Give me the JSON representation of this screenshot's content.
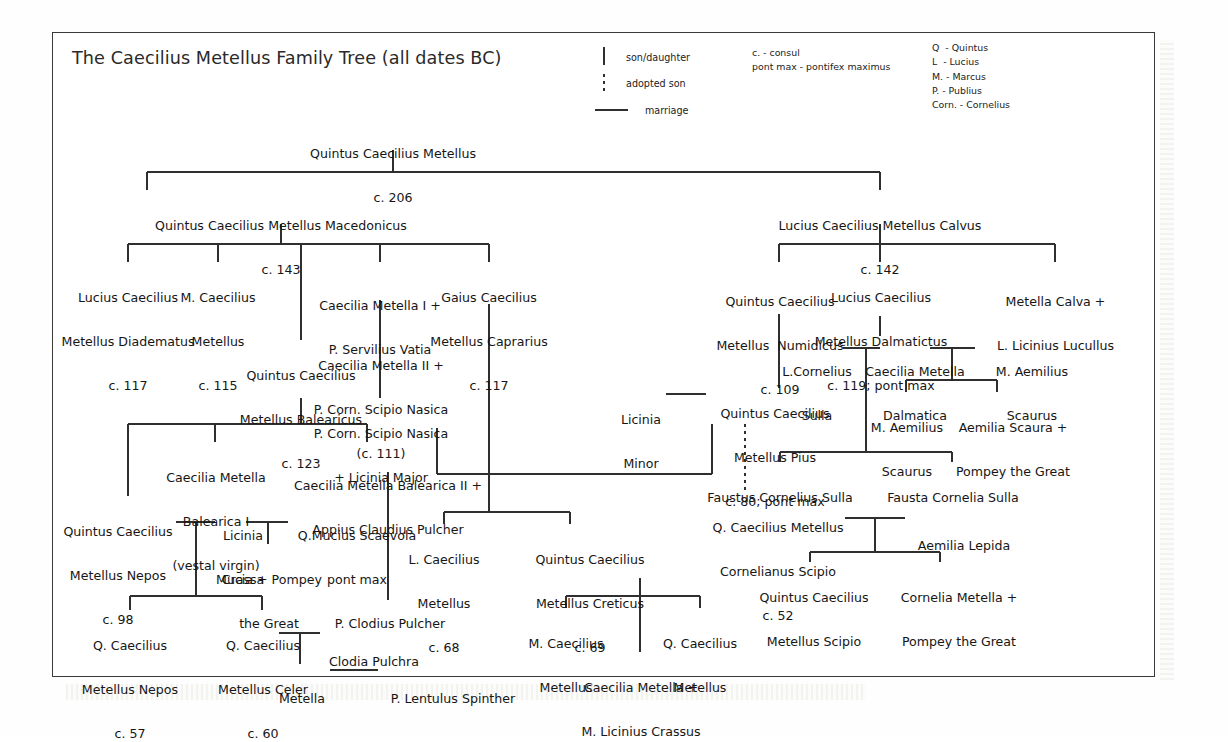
{
  "title": "The Caecilius Metellus Family Tree (all dates BC)",
  "legend": {
    "son_daughter": "son/daughter",
    "adopted_son": "adopted son",
    "marriage": "marriage",
    "abbrev_terms": "c. - consul\npont max - pontifex maximus",
    "abbrev_names": "Q  - Quintus\nL  - Lucius\nM. - Marcus\nP. - Publius\nCorn. - Cornelius"
  },
  "colors": {
    "ink": "#161616",
    "line": "#2f2f2f",
    "frame": "#3a3a3a",
    "page": "#ffffff"
  },
  "people": {
    "root": {
      "lines": [
        "Quintus Caecilius Metellus",
        "c. 206"
      ]
    },
    "macedonicus": {
      "lines": [
        "Quintus Caecilius Metellus Macedonicus",
        "c. 143"
      ]
    },
    "calvus": {
      "lines": [
        "Lucius Caecilius Metellus Calvus",
        "c. 142"
      ]
    },
    "diadematus": {
      "lines": [
        "Lucius Caecilius",
        "Metellus Diadematus",
        "c. 117"
      ]
    },
    "m_metellus": {
      "lines": [
        "M. Caecilius",
        "Metellus",
        "c. 115"
      ]
    },
    "metella1": {
      "lines": [
        "Caecilia Metella I +",
        "P. Servilius Vatia"
      ]
    },
    "caprarius": {
      "lines": [
        "Gaius Caecilius",
        "Metellus Caprarius",
        "c. 117"
      ]
    },
    "numidicus": {
      "lines": [
        "Quintus Caecilius",
        "Metellus  Numidicus",
        "c. 109"
      ]
    },
    "dalmaticus": {
      "lines": [
        "Lucius Caecilius",
        "Metellus Dalmatictus",
        "c. 119; pont max"
      ]
    },
    "metella_calva": {
      "lines": [
        "Metella Calva +",
        "L. Licinius Lucullus"
      ]
    },
    "balearicus": {
      "lines": [
        "Quintus Caecilius",
        "Metellus Balearicus",
        "c. 123"
      ]
    },
    "metella2": {
      "lines": [
        "Caecilia Metella II +",
        "P. Corn. Scipio Nasica",
        "(c. 111)"
      ]
    },
    "nasica_son": {
      "lines": [
        "P. Corn. Scipio Nasica",
        "+ Licinia Major"
      ]
    },
    "sulla": {
      "lines": [
        "L.Cornelius",
        "Sulla"
      ]
    },
    "dalmatica": {
      "lines": [
        "Caecilia Metella",
        "Dalmatica"
      ]
    },
    "scaurus_father": {
      "lines": [
        "M. Aemilius",
        "Scaurus"
      ]
    },
    "scaurus_son": {
      "lines": [
        "M. Aemilius",
        "Scaurus"
      ]
    },
    "aemilia_scaura": {
      "lines": [
        "Aemilia Scaura +",
        "Pompey the Great"
      ]
    },
    "licinia_minor": {
      "lines": [
        "Licinia",
        "Minor"
      ]
    },
    "pius": {
      "lines": [
        "Quintus Caecilius",
        "Metellus Pius",
        "c. 80; pont max"
      ]
    },
    "faustus": {
      "lines": [
        "Faustus Cornelius Sulla"
      ]
    },
    "fausta": {
      "lines": [
        "Fausta Cornelia Sulla"
      ]
    },
    "balearica1": {
      "lines": [
        "Caecilia Metella",
        "Balearica I",
        "(vestal virgin)"
      ]
    },
    "balearica2": {
      "lines": [
        "Caecilia Metella Balearica II +",
        "Appius Claudius Pulcher"
      ]
    },
    "nepos_elder": {
      "lines": [
        "Quintus Caecilius",
        "Metellus Nepos",
        "c. 98"
      ]
    },
    "licinia_crassa": {
      "lines": [
        "Licinia",
        "Crassa"
      ]
    },
    "scaevola": {
      "lines": [
        "Q.Mucius Scaevola",
        "pont max"
      ]
    },
    "mucia": {
      "lines": [
        "Mucia + Pompey",
        "the Great"
      ]
    },
    "nepos_younger": {
      "lines": [
        "Q. Caecilius",
        "Metellus Nepos",
        "c. 57"
      ]
    },
    "celer": {
      "lines": [
        "Q. Caecilius",
        "Metellus Celer",
        "c. 60"
      ]
    },
    "clodius": {
      "lines": [
        "P. Clodius Pulcher"
      ]
    },
    "clodia": {
      "lines": [
        "Clodia Pulchra"
      ]
    },
    "metella_lentulus": {
      "lines": [
        "Metella"
      ]
    },
    "lentulus": {
      "lines": [
        "P. Lentulus Spinther"
      ]
    },
    "l_metellus68": {
      "lines": [
        "L. Caecilius",
        "Metellus",
        "c. 68"
      ]
    },
    "creticus": {
      "lines": [
        "Quintus Caecilius",
        "Metellus Creticus",
        "c. 69"
      ]
    },
    "m_metellus_c": {
      "lines": [
        "M. Caecilius",
        "Metellus"
      ]
    },
    "q_metellus_c": {
      "lines": [
        "Q. Caecilius",
        "Metellus"
      ]
    },
    "metella_crassus": {
      "lines": [
        "Caecilia Metella +",
        "M. Licinius Crassus"
      ]
    },
    "cornelianus": {
      "lines": [
        "Q. Caecilius Metellus",
        "Cornelianus Scipio",
        "c. 52"
      ]
    },
    "aemilia_lepida": {
      "lines": [
        "Aemilia Lepida"
      ]
    },
    "metellus_scipio": {
      "lines": [
        "Quintus Caecilius",
        "Metellus Scipio"
      ]
    },
    "cornelia_metella": {
      "lines": [
        "Cornelia Metella +",
        "Pompey the Great"
      ]
    }
  }
}
